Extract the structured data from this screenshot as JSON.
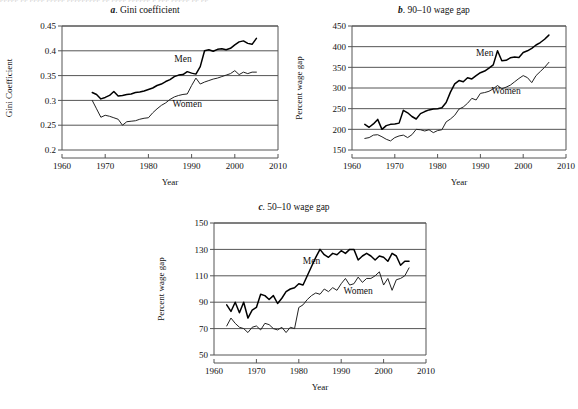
{
  "figure": {
    "top_cutoff_text": "ppppp pp pppp ppppp ppppppppp pp pppp pppppp p ppp ppppp pp pp",
    "axis_color": "#555555",
    "gridline_color": "#555555",
    "men_line_color": "#000000",
    "women_line_color": "#222222",
    "background_color": "#ffffff"
  },
  "chart_data": [
    {
      "id": "a",
      "type": "line",
      "panel_letter": "a",
      "title": "Gini coefficient",
      "title_full": "a. Gini coefficient",
      "xlabel": "Year",
      "ylabel": "Gini Coefficient",
      "xlim": [
        1960,
        2010
      ],
      "ylim": [
        0.2,
        0.45
      ],
      "xticks": [
        1960,
        1970,
        1980,
        1990,
        2000,
        2010
      ],
      "yticks": [
        0.2,
        0.25,
        0.3,
        0.35,
        0.4,
        0.45
      ],
      "grid": true,
      "legend": "inline-labels",
      "series": [
        {
          "name": "Men",
          "label_x": 1988,
          "label_y": 0.378,
          "x": [
            1967,
            1968,
            1969,
            1970,
            1971,
            1972,
            1973,
            1974,
            1975,
            1976,
            1977,
            1978,
            1979,
            1980,
            1981,
            1982,
            1983,
            1984,
            1985,
            1986,
            1987,
            1988,
            1989,
            1990,
            1991,
            1992,
            1993,
            1994,
            1995,
            1996,
            1997,
            1998,
            1999,
            2000,
            2001,
            2002,
            2003,
            2004,
            2005
          ],
          "values": [
            0.316,
            0.312,
            0.303,
            0.306,
            0.31,
            0.318,
            0.309,
            0.31,
            0.312,
            0.313,
            0.316,
            0.317,
            0.319,
            0.322,
            0.325,
            0.33,
            0.333,
            0.338,
            0.342,
            0.348,
            0.351,
            0.352,
            0.358,
            0.355,
            0.353,
            0.368,
            0.4,
            0.402,
            0.399,
            0.403,
            0.404,
            0.402,
            0.405,
            0.412,
            0.418,
            0.42,
            0.415,
            0.413,
            0.425
          ]
        },
        {
          "name": "Women",
          "label_x": 1989,
          "label_y": 0.287,
          "x": [
            1967,
            1968,
            1969,
            1970,
            1971,
            1972,
            1973,
            1974,
            1975,
            1976,
            1977,
            1978,
            1979,
            1980,
            1981,
            1982,
            1983,
            1984,
            1985,
            1986,
            1987,
            1988,
            1989,
            1990,
            1991,
            1992,
            1993,
            1994,
            1995,
            1996,
            1997,
            1998,
            1999,
            2000,
            2001,
            2002,
            2003,
            2004,
            2005
          ],
          "values": [
            0.3,
            0.283,
            0.266,
            0.27,
            0.268,
            0.265,
            0.262,
            0.25,
            0.257,
            0.258,
            0.259,
            0.262,
            0.264,
            0.265,
            0.275,
            0.283,
            0.29,
            0.295,
            0.302,
            0.307,
            0.31,
            0.312,
            0.313,
            0.33,
            0.345,
            0.333,
            0.337,
            0.34,
            0.343,
            0.345,
            0.348,
            0.351,
            0.354,
            0.36,
            0.352,
            0.357,
            0.354,
            0.357,
            0.357
          ]
        }
      ]
    },
    {
      "id": "b",
      "type": "line",
      "panel_letter": "b",
      "title": "90–10 wage gap",
      "title_full": "b. 90–10 wage gap",
      "xlabel": "Year",
      "ylabel": "Percent wage gap",
      "xlim": [
        1960,
        2010
      ],
      "ylim": [
        150,
        450
      ],
      "xticks": [
        1960,
        1970,
        1980,
        1990,
        2000,
        2010
      ],
      "yticks": [
        150,
        200,
        250,
        300,
        350,
        400,
        450
      ],
      "grid": true,
      "legend": "inline-labels",
      "series": [
        {
          "name": "Men",
          "label_x": 1991,
          "label_y": 378,
          "x": [
            1963,
            1964,
            1965,
            1966,
            1967,
            1968,
            1969,
            1970,
            1971,
            1972,
            1973,
            1974,
            1975,
            1976,
            1977,
            1978,
            1979,
            1980,
            1981,
            1982,
            1983,
            1984,
            1985,
            1986,
            1987,
            1988,
            1989,
            1990,
            1991,
            1992,
            1993,
            1994,
            1995,
            1996,
            1997,
            1998,
            1999,
            2000,
            2001,
            2002,
            2003,
            2004,
            2005,
            2006
          ],
          "values": [
            212,
            205,
            213,
            224,
            200,
            209,
            212,
            213,
            215,
            246,
            240,
            231,
            225,
            238,
            243,
            247,
            249,
            250,
            252,
            265,
            290,
            310,
            318,
            315,
            325,
            322,
            330,
            337,
            341,
            348,
            356,
            390,
            366,
            367,
            373,
            375,
            374,
            386,
            390,
            396,
            404,
            410,
            418,
            428
          ]
        },
        {
          "name": "Women",
          "label_x": 1996,
          "label_y": 285,
          "x": [
            1963,
            1964,
            1965,
            1966,
            1967,
            1968,
            1969,
            1970,
            1971,
            1972,
            1973,
            1974,
            1975,
            1976,
            1977,
            1978,
            1979,
            1980,
            1981,
            1982,
            1983,
            1984,
            1985,
            1986,
            1987,
            1988,
            1989,
            1990,
            1991,
            1992,
            1993,
            1994,
            1995,
            1996,
            1997,
            1998,
            1999,
            2000,
            2001,
            2002,
            2003,
            2004,
            2005,
            2006
          ],
          "values": [
            178,
            180,
            186,
            187,
            182,
            176,
            172,
            180,
            184,
            186,
            180,
            187,
            200,
            199,
            196,
            199,
            192,
            197,
            199,
            218,
            225,
            234,
            249,
            254,
            263,
            275,
            271,
            287,
            289,
            292,
            298,
            306,
            298,
            302,
            307,
            315,
            323,
            330,
            325,
            313,
            330,
            340,
            350,
            362
          ]
        }
      ]
    },
    {
      "id": "c",
      "type": "line",
      "panel_letter": "c",
      "title": "50–10 wage gap",
      "title_full": "c. 50–10 wage gap",
      "xlabel": "Year",
      "ylabel": "Percent wage gap",
      "xlim": [
        1960,
        2010
      ],
      "ylim": [
        50,
        150
      ],
      "xticks": [
        1960,
        1970,
        1980,
        1990,
        2000,
        2010
      ],
      "yticks": [
        50,
        70,
        90,
        110,
        130,
        150
      ],
      "grid": true,
      "legend": "inline-labels",
      "series": [
        {
          "name": "Men",
          "label_x": 1983,
          "label_y": 119,
          "x": [
            1963,
            1964,
            1965,
            1966,
            1967,
            1968,
            1969,
            1970,
            1971,
            1972,
            1973,
            1974,
            1975,
            1976,
            1977,
            1978,
            1979,
            1980,
            1981,
            1982,
            1983,
            1984,
            1985,
            1986,
            1987,
            1988,
            1989,
            1990,
            1991,
            1992,
            1993,
            1994,
            1995,
            1996,
            1997,
            1998,
            1999,
            2000,
            2001,
            2002,
            2003,
            2004,
            2005,
            2006
          ],
          "values": [
            88,
            83,
            90,
            82,
            90,
            78,
            84,
            86,
            96,
            95,
            92,
            95,
            89,
            93,
            98,
            100,
            101,
            104,
            103,
            110,
            117,
            124,
            130,
            126,
            124,
            127,
            126,
            129,
            127,
            130,
            130,
            122,
            125,
            127,
            125,
            122,
            125,
            124,
            121,
            127,
            125,
            118,
            121,
            121
          ]
        },
        {
          "name": "Women",
          "label_x": 1994,
          "label_y": 96,
          "x": [
            1963,
            1964,
            1965,
            1966,
            1967,
            1968,
            1969,
            1970,
            1971,
            1972,
            1973,
            1974,
            1975,
            1976,
            1977,
            1978,
            1979,
            1980,
            1981,
            1982,
            1983,
            1984,
            1985,
            1986,
            1987,
            1988,
            1989,
            1990,
            1991,
            1992,
            1993,
            1994,
            1995,
            1996,
            1997,
            1998,
            1999,
            2000,
            2001,
            2002,
            2003,
            2004,
            2005,
            2006
          ],
          "values": [
            72,
            78,
            74,
            71,
            70,
            67,
            71,
            72,
            69,
            74,
            73,
            70,
            69,
            71,
            67,
            71,
            70,
            86,
            88,
            92,
            95,
            97,
            96,
            100,
            98,
            101,
            99,
            104,
            108,
            103,
            104,
            109,
            105,
            108,
            108,
            110,
            113,
            103,
            108,
            99,
            107,
            108,
            110,
            116
          ]
        }
      ]
    }
  ]
}
